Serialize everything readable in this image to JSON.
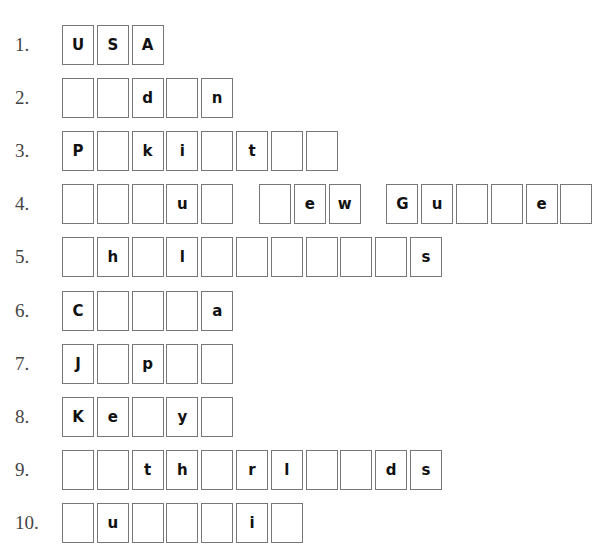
{
  "puzzle": {
    "rows": [
      {
        "number": "1.",
        "words": [
          [
            "U",
            "S",
            "A"
          ]
        ]
      },
      {
        "number": "2.",
        "words": [
          [
            "",
            "",
            "d",
            "",
            "n"
          ]
        ]
      },
      {
        "number": "3.",
        "words": [
          [
            "P",
            "",
            "k",
            "i",
            "",
            "t",
            "",
            ""
          ]
        ]
      },
      {
        "number": "4.",
        "words": [
          [
            "",
            "",
            "",
            "u",
            ""
          ],
          [
            "",
            "e",
            "w"
          ],
          [
            "G",
            "u",
            "",
            "",
            "e",
            ""
          ]
        ]
      },
      {
        "number": "5.",
        "words": [
          [
            "",
            "h",
            "",
            "l",
            "",
            "",
            "",
            "",
            "",
            "",
            "s"
          ]
        ]
      },
      {
        "number": "6.",
        "words": [
          [
            "C",
            "",
            "",
            "",
            "a"
          ]
        ]
      },
      {
        "number": "7.",
        "words": [
          [
            "J",
            "",
            "p",
            "",
            ""
          ]
        ]
      },
      {
        "number": "8.",
        "words": [
          [
            "K",
            "e",
            "",
            "y",
            ""
          ]
        ]
      },
      {
        "number": "9.",
        "words": [
          [
            "",
            "",
            "t",
            "h",
            "",
            "r",
            "l",
            "",
            "",
            "d",
            "s"
          ]
        ]
      },
      {
        "number": "10.",
        "words": [
          [
            "",
            "u",
            "",
            "",
            "",
            "i",
            ""
          ]
        ]
      }
    ]
  }
}
